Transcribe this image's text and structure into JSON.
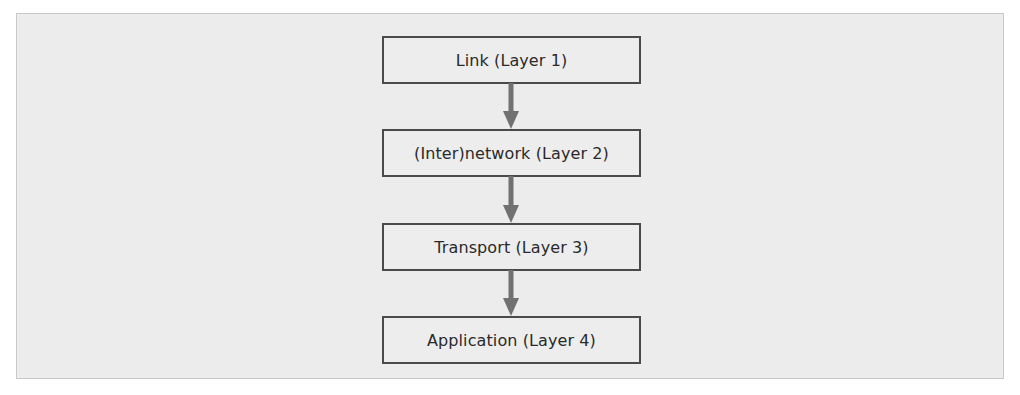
{
  "diagram": {
    "type": "vertical-flow",
    "layers": [
      {
        "label": "Link (Layer 1)"
      },
      {
        "label": "(Inter)network (Layer 2)"
      },
      {
        "label": "Transport (Layer 3)"
      },
      {
        "label": "Application (Layer 4)"
      }
    ],
    "connections": [
      {
        "from": "Link (Layer 1)",
        "to": "(Inter)network (Layer 2)",
        "direction": "down"
      },
      {
        "from": "(Inter)network (Layer 2)",
        "to": "Transport (Layer 3)",
        "direction": "down"
      },
      {
        "from": "Transport (Layer 3)",
        "to": "Application (Layer 4)",
        "direction": "down"
      }
    ],
    "colors": {
      "background": "#ececec",
      "box_border": "#4a4a4a",
      "arrow": "#717171",
      "text": "#2a2a2a"
    }
  }
}
